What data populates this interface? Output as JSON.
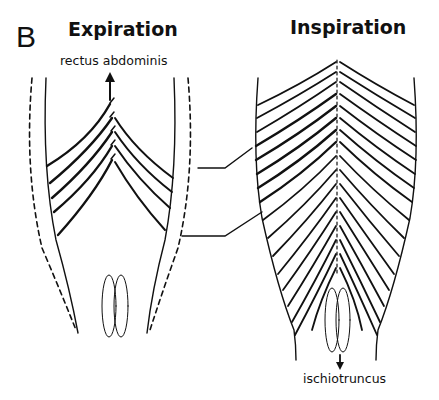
{
  "figure": {
    "panel_letter": "B",
    "left_panel": {
      "title": "Expiration",
      "arrow_label": "rectus abdominis",
      "arrow_direction": "up",
      "visible_segments": 5
    },
    "right_panel": {
      "title": "Inspiration",
      "arrow_label": "ischiotruncus",
      "arrow_direction": "down",
      "visible_segments": 18
    },
    "colors": {
      "line": "#111111",
      "background": "#ffffff"
    }
  }
}
